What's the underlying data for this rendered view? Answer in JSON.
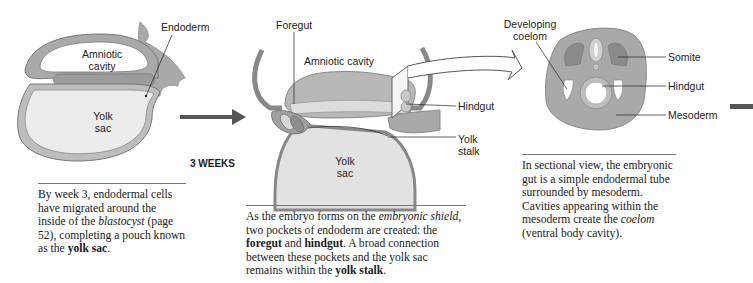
{
  "panel1": {
    "labels": {
      "endoderm": "Endoderm",
      "amniotic_cavity_line1": "Amniotic",
      "amniotic_cavity_line2": "cavity",
      "yolk_sac_line1": "Yolk",
      "yolk_sac_line2": "sac"
    },
    "caption": {
      "t1": "By week 3, endodermal cells have migrated around the inside of the ",
      "i1": "blastocyst",
      "t2": " (page 52), completing a pouch known as the ",
      "b1": "yolk sac",
      "t3": "."
    }
  },
  "stage_label": "3 WEEKS",
  "panel2": {
    "labels": {
      "foregut": "Foregut",
      "amniotic_cavity": "Amniotic cavity",
      "hindgut": "Hindgut",
      "yolk_stalk_line1": "Yolk",
      "yolk_stalk_line2": "stalk",
      "yolk_sac_line1": "Yolk",
      "yolk_sac_line2": "sac"
    },
    "caption": {
      "t1": "As the embryo forms on the ",
      "i1": "embryonic shield",
      "t2": ", two pockets of endoderm are created: the ",
      "b1": "foregut",
      "t3": " and ",
      "b2": "hindgut",
      "t4": ". A broad connection between these pockets and the yolk sac remains within the ",
      "b3": "yolk stalk",
      "t5": "."
    }
  },
  "panel3": {
    "labels": {
      "developing_coelom_line1": "Developing",
      "developing_coelom_line2": "coelom",
      "somite": "Somite",
      "hindgut": "Hindgut",
      "mesoderm": "Mesoderm"
    },
    "caption": {
      "t1": "In sectional view, the embryonic gut is a simple endodermal tube surrounded by mesoderm. Cavities appearing within the mesoderm create the ",
      "i1": "coelom",
      "t2": " (ventral body cavity)."
    }
  },
  "colors": {
    "tissue_gray": "#a9a9a9",
    "dark_gray": "#7c7c7c",
    "light_fill": "#ececec",
    "arrow": "#555555"
  }
}
